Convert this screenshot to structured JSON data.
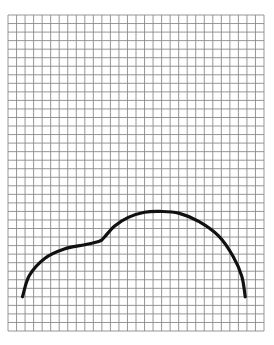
{
  "figure": {
    "colors": {
      "background": "#ffffff",
      "grid_line": "#8a8a8a",
      "curve": "#111111"
    }
  },
  "chart_data": {
    "type": "line",
    "title": "",
    "xlabel": "",
    "ylabel": "",
    "grid": true,
    "grid_units": {
      "columns": 30,
      "rows": 37
    },
    "legend": "none",
    "series": [
      {
        "name": "outline-curve",
        "units": "grid cells from top-left corner of grid",
        "points": [
          [
            1.7,
            33.0
          ],
          [
            2.5,
            30.5
          ],
          [
            4.3,
            28.5
          ],
          [
            6.6,
            27.4
          ],
          [
            9.0,
            26.9
          ],
          [
            10.7,
            26.5
          ],
          [
            11.3,
            26.0
          ],
          [
            12.5,
            24.7
          ],
          [
            14.1,
            23.7
          ],
          [
            16.0,
            23.1
          ],
          [
            17.8,
            23.0
          ],
          [
            20.0,
            23.2
          ],
          [
            22.4,
            24.2
          ],
          [
            24.7,
            25.9
          ],
          [
            26.4,
            28.3
          ],
          [
            27.4,
            30.6
          ],
          [
            27.8,
            33.0
          ]
        ]
      }
    ]
  }
}
